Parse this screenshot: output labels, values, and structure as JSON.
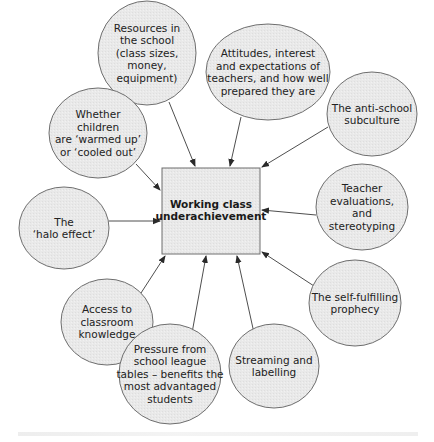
{
  "diagram": {
    "colors": {
      "node_fill": "#e8e8e8",
      "node_stroke": "#6e6e6e",
      "arrow": "#3a3a3a",
      "text": "#222222",
      "background": "#ffffff"
    },
    "center": {
      "id": "center",
      "lines": [
        "Working class",
        "underachievement"
      ],
      "x": 162,
      "y": 168,
      "w": 98,
      "h": 86
    },
    "nodes": [
      {
        "id": "resources",
        "lines": [
          "Resources in",
          "the school",
          "(class sizes,",
          "money,",
          "equipment)"
        ],
        "cx": 147,
        "cy": 53,
        "rx": 49,
        "ry": 52,
        "from": [
          169,
          102
        ],
        "to": [
          195,
          166
        ]
      },
      {
        "id": "attitudes",
        "lines": [
          "Attitudes, interest",
          "and expectations of",
          "teachers, and how well",
          "prepared they are"
        ],
        "cx": 268,
        "cy": 72,
        "rx": 62,
        "ry": 48,
        "from": [
          241,
          117
        ],
        "to": [
          230,
          166
        ]
      },
      {
        "id": "anti-school",
        "lines": [
          "The anti-school",
          "subculture"
        ],
        "cx": 372,
        "cy": 114,
        "rx": 45,
        "ry": 42,
        "from": [
          328,
          127
        ],
        "to": [
          262,
          167
        ]
      },
      {
        "id": "warmed-up",
        "lines": [
          "Whether",
          "children",
          "are ‘warmed up’",
          "or ‘cooled out’"
        ],
        "cx": 98,
        "cy": 133,
        "rx": 49,
        "ry": 45,
        "from": [
          136,
          164
        ],
        "to": [
          160,
          190
        ]
      },
      {
        "id": "halo",
        "lines": [
          "The",
          "‘halo effect’"
        ],
        "cx": 64,
        "cy": 228,
        "rx": 45,
        "ry": 41,
        "from": [
          109,
          221
        ],
        "to": [
          160,
          221
        ]
      },
      {
        "id": "teacher-evaluations",
        "lines": [
          "Teacher",
          "evaluations,",
          "and",
          "stereotyping"
        ],
        "cx": 362,
        "cy": 207,
        "rx": 46,
        "ry": 43,
        "from": [
          316,
          215
        ],
        "to": [
          262,
          210
        ]
      },
      {
        "id": "self-fulfilling",
        "lines": [
          "The self-fulfilling",
          "prophecy"
        ],
        "cx": 355,
        "cy": 303,
        "rx": 46,
        "ry": 43,
        "from": [
          314,
          286
        ],
        "to": [
          262,
          252
        ]
      },
      {
        "id": "access",
        "lines": [
          "Access to",
          "classroom",
          "knowledge"
        ],
        "cx": 107,
        "cy": 322,
        "rx": 46,
        "ry": 43,
        "from": [
          141,
          293
        ],
        "to": [
          165,
          256
        ]
      },
      {
        "id": "pressure",
        "lines": [
          "Pressure from",
          "school league",
          "tables – benefits the",
          "most advantaged",
          "students"
        ],
        "cx": 170,
        "cy": 374,
        "rx": 51,
        "ry": 50,
        "from": [
          190,
          344
        ],
        "to": [
          206,
          256
        ]
      },
      {
        "id": "streaming",
        "lines": [
          "Streaming and",
          "labelling"
        ],
        "cx": 274,
        "cy": 366,
        "rx": 45,
        "ry": 42,
        "from": [
          254,
          333
        ],
        "to": [
          237,
          256
        ]
      }
    ]
  }
}
